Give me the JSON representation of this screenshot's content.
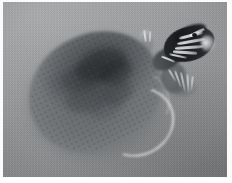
{
  "image": {
    "type": "photograph",
    "subject": "turtle",
    "subject_common_name": "Painted turtle",
    "view": "top-down",
    "color_mode": "grayscale",
    "scene": "turtle swimming in water",
    "width": 232,
    "height": 183,
    "caption": "",
    "alt_text": "Grayscale top-down photograph of a turtle swimming, with a mottled oval shell and a dark striped head extending toward the upper right."
  },
  "frame": {
    "border_color": "#fbfbfb",
    "border_width_px": 3
  },
  "palette": {
    "background_water": "#939597",
    "shell_mid": "#76797c",
    "shell_dark": "#3a3d40",
    "shell_light": "#8b8e90",
    "head_dark": "#1b1d20",
    "stripe_light": "#f4f6f8",
    "claw_light": "#dee1e4",
    "rim_highlight": "#eef0f2"
  },
  "regions": {
    "shell_label": "carapace",
    "head_label": "head",
    "neck_label": "neck",
    "foreleg_label": "front limb",
    "hindleg_label": "rear limb",
    "water_label": "water surface"
  }
}
